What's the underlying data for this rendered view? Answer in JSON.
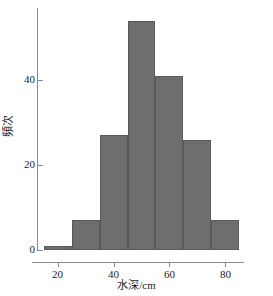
{
  "chart_data": {
    "type": "bar",
    "title": "",
    "subtitle": "",
    "xlabel": "水深/cm",
    "ylabel": "頻次",
    "categories": [
      "15-25",
      "25-35",
      "35-45",
      "45-55",
      "55-65",
      "65-75",
      "75-85"
    ],
    "bin_edges": [
      15,
      25,
      35,
      45,
      55,
      65,
      75,
      85
    ],
    "values": [
      1,
      7,
      27,
      54,
      41,
      26,
      7
    ],
    "xlim": [
      13,
      87
    ],
    "ylim": [
      0,
      57
    ],
    "xticks": [
      20,
      40,
      60,
      80
    ],
    "xtick_labels": [
      "20",
      "40",
      "60",
      "80"
    ],
    "yticks": [
      0,
      20,
      40
    ],
    "ytick_labels": [
      "0",
      "20",
      "40"
    ],
    "grid": false,
    "legend": null,
    "legend_position": "none",
    "bar_color": "#6e6e6e",
    "bar_edge_color": "#5a5a5a",
    "axis_color": "#8a8a8a",
    "background_color": "#ffffff"
  },
  "caption": {
    "text": ""
  }
}
